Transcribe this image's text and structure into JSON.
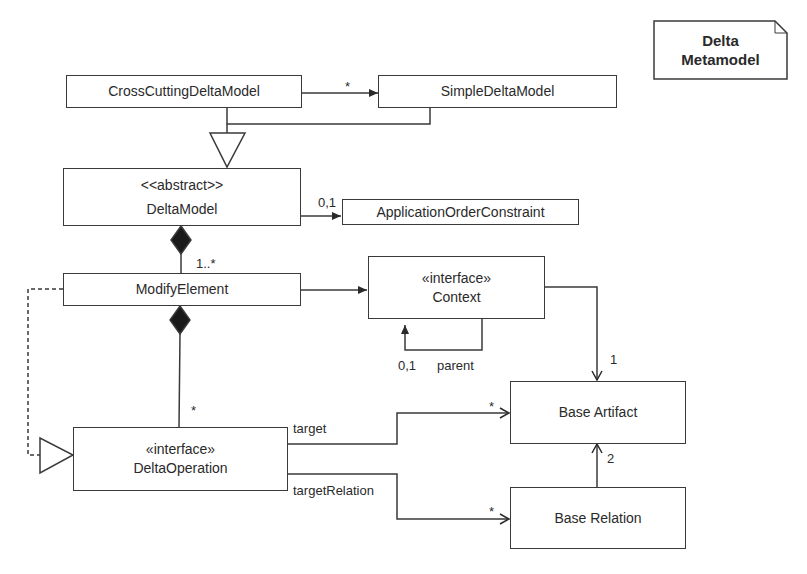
{
  "diagram": {
    "type": "uml-class-diagram",
    "note": {
      "line1": "Delta",
      "line2": "Metamodel"
    },
    "classes": {
      "cross_cutting_delta_model": {
        "name": "CrossCuttingDeltaModel"
      },
      "simple_delta_model": {
        "name": "SimpleDeltaModel"
      },
      "delta_model": {
        "stereotype": "<<abstract>>",
        "name": "DeltaModel"
      },
      "application_order_constraint": {
        "name": "ApplicationOrderConstraint"
      },
      "modify_element": {
        "name": "ModifyElement"
      },
      "context": {
        "stereotype": "«interface»",
        "name": "Context"
      },
      "delta_operation": {
        "stereotype": "«interface»",
        "name": "DeltaOperation"
      },
      "base_artifact": {
        "name": "Base Artifact"
      },
      "base_relation": {
        "name": "Base Relation"
      }
    },
    "labels": {
      "cross_to_simple_mult": "*",
      "delta_to_aoc_mult": "0,1",
      "delta_to_modify_mult": "1..*",
      "modify_to_op_mult": "*",
      "context_parent_mult": "0,1",
      "context_parent_role": "parent",
      "context_to_artifact_mult": "1",
      "target_role": "target",
      "target_mult": "*",
      "target_relation_role": "targetRelation",
      "target_relation_mult": "*",
      "relation_to_artifact_mult": "2"
    },
    "colors": {
      "stroke": "#3a3a3a",
      "fill": "#ffffff",
      "diamond": "#1a1a1a"
    }
  }
}
